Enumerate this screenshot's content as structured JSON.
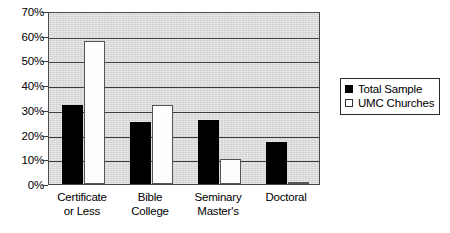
{
  "chart_data": {
    "type": "bar",
    "title": "",
    "subtitle": "",
    "xlabel": "",
    "ylabel": "",
    "categories": [
      "Certificate or Less",
      "Bible College",
      "Seminary Master's",
      "Doctoral"
    ],
    "category_lines": [
      [
        "Certificate",
        "or Less"
      ],
      [
        "Bible",
        "College"
      ],
      [
        "Seminary",
        "Master's"
      ],
      [
        "Doctoral"
      ]
    ],
    "series": [
      {
        "name": "Total Sample",
        "values": [
          32,
          25,
          26,
          17
        ],
        "color": "#000000"
      },
      {
        "name": "UMC Churches",
        "values": [
          58,
          32,
          10,
          1
        ],
        "color": "#ffffff"
      }
    ],
    "ylim": [
      0,
      70
    ],
    "ytick_values": [
      0,
      10,
      20,
      30,
      40,
      50,
      60,
      70
    ],
    "ytick_labels": [
      "0%",
      "10%",
      "20%",
      "30%",
      "40%",
      "50%",
      "60%",
      "70%"
    ],
    "grid": true,
    "grid_axis": "y",
    "legend_position": "right",
    "plot_background": "#d9d9d9",
    "value_format": "percent"
  },
  "legend": {
    "items": [
      {
        "label": "Total Sample",
        "swatch": "filled-square-black"
      },
      {
        "label": "UMC Churches",
        "swatch": "open-square-white"
      }
    ]
  }
}
